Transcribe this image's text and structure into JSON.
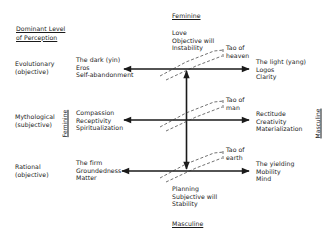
{
  "header": {
    "dominant_level_line1": "Dominant Level",
    "dominant_level_line2": "of Perception"
  },
  "axes": {
    "top": "Feminine",
    "bottom": "Masculine",
    "left_vertical": "Feminine",
    "right_vertical": "Masculine"
  },
  "levels": [
    {
      "name": "Evolutionary",
      "sub": "(objective)"
    },
    {
      "name": "Mythological",
      "sub": "(subjective)"
    },
    {
      "name": "Rational",
      "sub": "(objective)"
    }
  ],
  "left_terms": [
    [
      "The dark (yin)",
      "Eros",
      "Self-abandonment"
    ],
    [
      "Compassion",
      "Receptivity",
      "Spiritualization"
    ],
    [
      "The firm",
      "Groundedness",
      "Matter"
    ]
  ],
  "right_terms": [
    [
      "The light (yang)",
      "Logos",
      "Clarity"
    ],
    [
      "Rectitude",
      "Creativity",
      "Materialization"
    ],
    [
      "The yielding",
      "Mobility",
      "Mind"
    ]
  ],
  "top_terms": [
    "Love",
    "Objective will",
    "Instability"
  ],
  "bottom_terms": [
    "Planning",
    "Subjective will",
    "Stability"
  ],
  "tao_labels": [
    [
      "Tao of",
      "heaven"
    ],
    [
      "Tao of",
      "man"
    ],
    [
      "Tao of",
      "earth"
    ]
  ]
}
